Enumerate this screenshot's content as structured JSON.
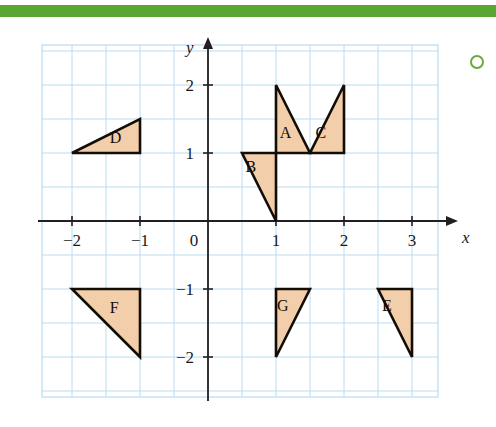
{
  "page": {
    "background_color": "#ffffff",
    "accent_bar_color": "#5aa632",
    "marker_icon": "circle-outline-icon",
    "marker_color": "#6aa93a"
  },
  "chart_data": {
    "type": "scatter",
    "title": "",
    "xlabel": "x",
    "ylabel": "y",
    "xlim": [
      -2.5,
      3.5
    ],
    "ylim": [
      -2.5,
      2.5
    ],
    "x_ticks": [
      -2,
      -1,
      0,
      1,
      2,
      3
    ],
    "x_tick_labels": [
      "−2",
      "−1",
      "0",
      "1",
      "2",
      "3"
    ],
    "y_ticks": [
      2,
      1,
      -1,
      -2
    ],
    "y_tick_labels": [
      "2",
      "1",
      "−1",
      "−2"
    ],
    "origin_label": "0",
    "grid": true,
    "grid_step": 0.5,
    "grid_color": "#badcf0",
    "axis_color": "#231f20",
    "shape_fill": "#f2ceab",
    "shape_stroke": "#120d07",
    "legend": "none",
    "shapes": [
      {
        "label": "A",
        "points": [
          [
            1,
            2
          ],
          [
            1,
            1
          ],
          [
            1.5,
            1
          ]
        ],
        "label_pos": [
          1.14,
          1.22
        ]
      },
      {
        "label": "B",
        "points": [
          [
            0.5,
            1
          ],
          [
            1,
            1
          ],
          [
            1,
            0
          ]
        ],
        "label_pos": [
          0.63,
          0.72
        ]
      },
      {
        "label": "C",
        "points": [
          [
            2,
            2
          ],
          [
            2,
            1
          ],
          [
            1.5,
            1
          ]
        ],
        "label_pos": [
          1.66,
          1.22
        ]
      },
      {
        "label": "D",
        "points": [
          [
            -2,
            1
          ],
          [
            -1,
            1
          ],
          [
            -1,
            1.5
          ]
        ],
        "label_pos": [
          -1.36,
          1.14
        ]
      },
      {
        "label": "E",
        "points": [
          [
            2.5,
            -1
          ],
          [
            3,
            -1
          ],
          [
            3,
            -2
          ]
        ],
        "label_pos": [
          2.63,
          -1.32
        ]
      },
      {
        "label": "F",
        "points": [
          [
            -2,
            -1
          ],
          [
            -1,
            -1
          ],
          [
            -1,
            -2
          ]
        ],
        "label_pos": [
          -1.38,
          -1.35
        ]
      },
      {
        "label": "G",
        "points": [
          [
            1,
            -1
          ],
          [
            1.5,
            -1
          ],
          [
            1,
            -2
          ]
        ],
        "label_pos": [
          1.1,
          -1.32
        ]
      }
    ]
  }
}
